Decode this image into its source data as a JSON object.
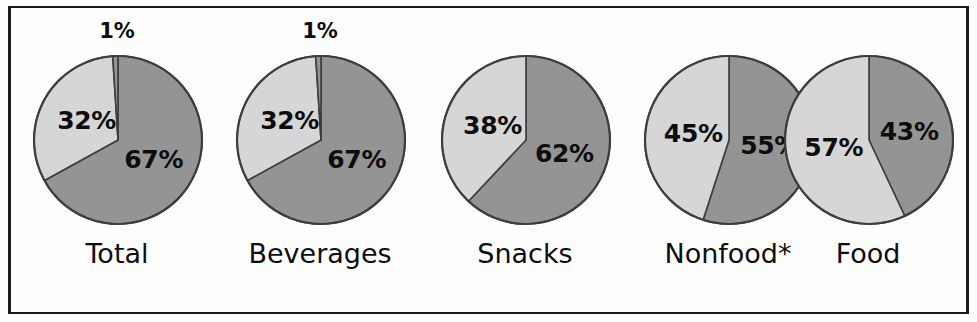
{
  "figure": {
    "background_color": "#fdfdfd",
    "border_color": "#1b1b1b",
    "dark_slice_color": "#949494",
    "light_slice_color": "#d6d6d6",
    "outline_color": "#3d3d3d",
    "text_color": "#0d0d0d"
  },
  "chart_data": {
    "type": "pie",
    "title": "",
    "subtitle": "",
    "xlabel": "",
    "ylabel": "",
    "legend_position": "none",
    "grid": false,
    "series_names": [
      "dark",
      "light",
      "sliver"
    ],
    "charts": [
      {
        "label": "Total",
        "slices": [
          {
            "name": "dark",
            "value": 67,
            "label": "67%",
            "color": "#949494"
          },
          {
            "name": "light",
            "value": 32,
            "label": "32%",
            "color": "#d6d6d6"
          },
          {
            "name": "sliver",
            "value": 1,
            "label": "1%",
            "color": "#949494"
          }
        ]
      },
      {
        "label": "Beverages",
        "slices": [
          {
            "name": "dark",
            "value": 67,
            "label": "67%",
            "color": "#949494"
          },
          {
            "name": "light",
            "value": 32,
            "label": "32%",
            "color": "#d6d6d6"
          },
          {
            "name": "sliver",
            "value": 1,
            "label": "1%",
            "color": "#949494"
          }
        ]
      },
      {
        "label": "Snacks",
        "slices": [
          {
            "name": "dark",
            "value": 62,
            "label": "62%",
            "color": "#949494"
          },
          {
            "name": "light",
            "value": 38,
            "label": "38%",
            "color": "#d6d6d6"
          }
        ]
      },
      {
        "label": "Nonfood*",
        "slices": [
          {
            "name": "dark",
            "value": 55,
            "label": "55%",
            "color": "#949494"
          },
          {
            "name": "light",
            "value": 45,
            "label": "45%",
            "color": "#d6d6d6"
          }
        ]
      },
      {
        "label": "Food",
        "slices": [
          {
            "name": "dark",
            "value": 43,
            "label": "43%",
            "color": "#949494"
          },
          {
            "name": "light",
            "value": 57,
            "label": "57%",
            "color": "#d6d6d6"
          }
        ]
      }
    ]
  },
  "layout": {
    "pie_radius": 84,
    "centers_x": [
      106,
      309,
      514,
      717,
      857
    ],
    "center_y": 131
  }
}
